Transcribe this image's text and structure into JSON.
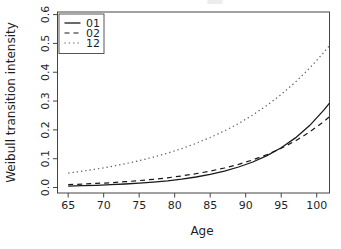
{
  "figure": {
    "background": "#ffffff",
    "axis_color": "#444444",
    "text_color": "#1f1f1f"
  },
  "chart_data": {
    "type": "line",
    "title": "",
    "xlabel": "Age",
    "ylabel": "Weibull transition intensity",
    "xlim": [
      63.5,
      101.8
    ],
    "ylim": [
      -0.019,
      0.609
    ],
    "x_ticks": [
      65,
      70,
      75,
      80,
      85,
      90,
      95,
      100
    ],
    "y_ticks": [
      "0.0",
      "0.1",
      "0.2",
      "0.3",
      "0.4",
      "0.5",
      "0.6"
    ],
    "grid": false,
    "legend_position": "top-left",
    "x": [
      65,
      67,
      69,
      71,
      73,
      75,
      77,
      79,
      81,
      83,
      85,
      87,
      89,
      91,
      93,
      95,
      97,
      99,
      101,
      101.8
    ],
    "series": [
      {
        "name": "01",
        "style": "solid",
        "color": "#1a1a1a",
        "values": [
          0.005,
          0.0062,
          0.0078,
          0.0097,
          0.0121,
          0.0151,
          0.0189,
          0.0235,
          0.0294,
          0.0366,
          0.0457,
          0.057,
          0.0711,
          0.0887,
          0.1107,
          0.1381,
          0.1723,
          0.215,
          0.2682,
          0.293
        ]
      },
      {
        "name": "02",
        "style": "dashed",
        "color": "#1a1a1a",
        "values": [
          0.01,
          0.0119,
          0.0142,
          0.0169,
          0.0201,
          0.0239,
          0.0284,
          0.0338,
          0.0402,
          0.0479,
          0.057,
          0.0678,
          0.0807,
          0.096,
          0.1143,
          0.136,
          0.1618,
          0.1926,
          0.2292,
          0.246
        ]
      },
      {
        "name": "12",
        "style": "dotted",
        "color": "#5a5a5a",
        "values": [
          0.05,
          0.0566,
          0.0641,
          0.0726,
          0.0823,
          0.0931,
          0.1054,
          0.1194,
          0.1352,
          0.1531,
          0.1734,
          0.1964,
          0.2223,
          0.2518,
          0.2852,
          0.3229,
          0.3657,
          0.4141,
          0.469,
          0.493
        ]
      }
    ]
  }
}
